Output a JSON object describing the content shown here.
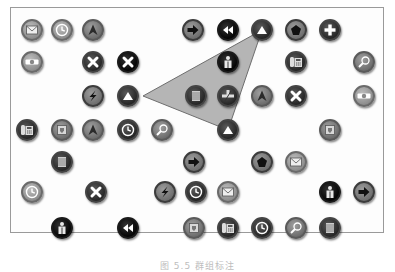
{
  "figure": {
    "caption": "图 5.5  群组标注",
    "lasso_polygon": [
      [
        143,
        96
      ],
      [
        262,
        30
      ],
      [
        228,
        130
      ]
    ],
    "lasso_fill": "#a8a8a8",
    "lasso_stroke": "#6e6e6e"
  },
  "icons": [
    {
      "type": "mail",
      "tone": "light",
      "x": 32,
      "y": 30
    },
    {
      "type": "clock",
      "tone": "light",
      "x": 62,
      "y": 30
    },
    {
      "type": "nav-arrow",
      "tone": "mid",
      "x": 93,
      "y": 30
    },
    {
      "type": "arrow-right",
      "tone": "ring",
      "x": 193,
      "y": 30
    },
    {
      "type": "rewind",
      "tone": "black",
      "x": 228,
      "y": 30
    },
    {
      "type": "triangle-up",
      "tone": "dark",
      "x": 262,
      "y": 30
    },
    {
      "type": "pentagon",
      "tone": "ring",
      "x": 296,
      "y": 30
    },
    {
      "type": "plus",
      "tone": "dark",
      "x": 330,
      "y": 30
    },
    {
      "type": "toggle",
      "tone": "light",
      "x": 32,
      "y": 62
    },
    {
      "type": "close",
      "tone": "dark",
      "x": 93,
      "y": 62
    },
    {
      "type": "close",
      "tone": "black",
      "x": 128,
      "y": 62
    },
    {
      "type": "person",
      "tone": "black",
      "x": 228,
      "y": 62
    },
    {
      "type": "phone",
      "tone": "dark",
      "x": 296,
      "y": 62
    },
    {
      "type": "search",
      "tone": "mid",
      "x": 364,
      "y": 62
    },
    {
      "type": "bolt",
      "tone": "ring",
      "x": 93,
      "y": 96
    },
    {
      "type": "triangle-up",
      "tone": "dark",
      "x": 128,
      "y": 96
    },
    {
      "type": "list",
      "tone": "dark",
      "x": 196,
      "y": 96
    },
    {
      "type": "plus-minus",
      "tone": "dark",
      "x": 228,
      "y": 96
    },
    {
      "type": "nav-arrow",
      "tone": "mid",
      "x": 262,
      "y": 96
    },
    {
      "type": "close",
      "tone": "dark",
      "x": 296,
      "y": 96
    },
    {
      "type": "toggle",
      "tone": "light",
      "x": 364,
      "y": 96
    },
    {
      "type": "phone",
      "tone": "dark",
      "x": 27,
      "y": 130
    },
    {
      "type": "shield",
      "tone": "mid",
      "x": 62,
      "y": 130
    },
    {
      "type": "nav-arrow",
      "tone": "mid",
      "x": 93,
      "y": 130
    },
    {
      "type": "clock",
      "tone": "dark",
      "x": 128,
      "y": 130
    },
    {
      "type": "search",
      "tone": "mid",
      "x": 162,
      "y": 130
    },
    {
      "type": "triangle-up",
      "tone": "dark",
      "x": 228,
      "y": 130
    },
    {
      "type": "shield",
      "tone": "mid",
      "x": 330,
      "y": 130
    },
    {
      "type": "list",
      "tone": "dark",
      "x": 62,
      "y": 162
    },
    {
      "type": "arrow-right",
      "tone": "ring",
      "x": 194,
      "y": 162
    },
    {
      "type": "pentagon",
      "tone": "ring",
      "x": 262,
      "y": 162
    },
    {
      "type": "mail",
      "tone": "light",
      "x": 296,
      "y": 162
    },
    {
      "type": "clock",
      "tone": "light",
      "x": 32,
      "y": 192
    },
    {
      "type": "close",
      "tone": "dark",
      "x": 96,
      "y": 192
    },
    {
      "type": "bolt",
      "tone": "ring",
      "x": 165,
      "y": 192
    },
    {
      "type": "clock",
      "tone": "dark",
      "x": 196,
      "y": 192
    },
    {
      "type": "mail",
      "tone": "light",
      "x": 228,
      "y": 192
    },
    {
      "type": "person",
      "tone": "black",
      "x": 330,
      "y": 192
    },
    {
      "type": "arrow-right",
      "tone": "ring",
      "x": 364,
      "y": 192
    },
    {
      "type": "person",
      "tone": "black",
      "x": 62,
      "y": 228
    },
    {
      "type": "rewind",
      "tone": "black",
      "x": 128,
      "y": 228
    },
    {
      "type": "shield",
      "tone": "mid",
      "x": 194,
      "y": 228
    },
    {
      "type": "phone",
      "tone": "dark",
      "x": 228,
      "y": 228
    },
    {
      "type": "clock",
      "tone": "dark",
      "x": 262,
      "y": 228
    },
    {
      "type": "search",
      "tone": "mid",
      "x": 296,
      "y": 228
    },
    {
      "type": "list",
      "tone": "dark",
      "x": 330,
      "y": 228
    }
  ]
}
